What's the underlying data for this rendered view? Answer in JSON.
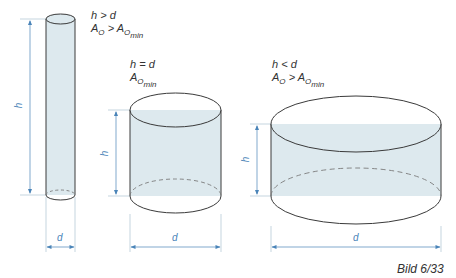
{
  "figure": {
    "caption": "Bild 6/33",
    "colors": {
      "outline": "#3a3a3a",
      "fill": "#dde9ee",
      "dimension": "#4a84b8"
    },
    "cylinders": [
      {
        "id": "tall",
        "condition": "h > d",
        "area_main": "A",
        "area_sub": "O",
        "relation": " > ",
        "area_min_main": "A",
        "area_min_sub": "O",
        "area_min_subsub": "min",
        "h_label": "h",
        "d_label": "d"
      },
      {
        "id": "equal",
        "condition": "h = d",
        "area_main": "A",
        "area_sub": "O",
        "area_min_subsub": "min",
        "h_label": "h",
        "d_label": "d"
      },
      {
        "id": "flat",
        "condition": "h < d",
        "area_main": "A",
        "area_sub": "O",
        "relation": " > ",
        "area_min_main": "A",
        "area_min_sub": "O",
        "area_min_subsub": "min",
        "h_label": "h",
        "d_label": "d"
      }
    ]
  }
}
